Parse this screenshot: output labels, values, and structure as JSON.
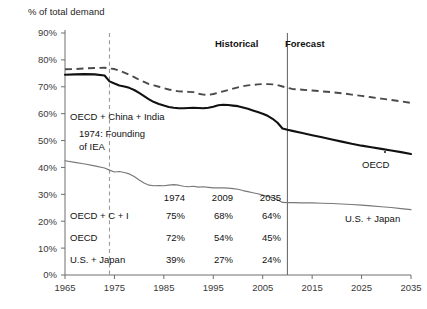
{
  "chart_data": {
    "type": "line",
    "title": "",
    "ylabel": "% of total demand",
    "xlabel": "",
    "ylim": [
      0,
      90
    ],
    "xlim": [
      1965,
      2035
    ],
    "grid": false,
    "legend_position": "inline-labels",
    "y_ticks": [
      "0%",
      "10%",
      "20%",
      "30%",
      "40%",
      "50%",
      "60%",
      "70%",
      "80%",
      "90%"
    ],
    "y_tick_values": [
      0,
      10,
      20,
      30,
      40,
      50,
      60,
      70,
      80,
      90
    ],
    "x_ticks": [
      "1965",
      "1975",
      "1985",
      "1995",
      "2005",
      "2015",
      "2025",
      "2035"
    ],
    "x_tick_values": [
      1965,
      1975,
      1985,
      1995,
      2005,
      2015,
      2025,
      2035
    ],
    "series": [
      {
        "name": "OECD + China + India",
        "style": "dashed",
        "color": "#4a4a4a",
        "x": [
          1965,
          1967,
          1969,
          1971,
          1973,
          1974,
          1975,
          1976,
          1977,
          1978,
          1979,
          1980,
          1981,
          1982,
          1983,
          1984,
          1985,
          1986,
          1987,
          1988,
          1989,
          1990,
          1991,
          1992,
          1993,
          1994,
          1995,
          1996,
          1997,
          1998,
          1999,
          2000,
          2001,
          2002,
          2003,
          2004,
          2005,
          2006,
          2007,
          2008,
          2009,
          2010,
          2011,
          2013,
          2015,
          2017,
          2019,
          2021,
          2023,
          2025,
          2027,
          2029,
          2031,
          2033,
          2035
        ],
        "y": [
          76.5,
          76.6,
          76.8,
          77.0,
          77.1,
          76.8,
          76.6,
          76.0,
          75.3,
          74.5,
          73.6,
          72.6,
          71.8,
          71.0,
          70.5,
          70.0,
          69.5,
          69.0,
          68.6,
          68.3,
          68.2,
          68.1,
          68.0,
          67.4,
          67.1,
          67.0,
          67.3,
          67.8,
          68.3,
          68.8,
          69.3,
          69.8,
          70.2,
          70.5,
          70.7,
          70.9,
          71.0,
          71.0,
          70.9,
          70.6,
          70.1,
          69.6,
          69.2,
          68.9,
          68.6,
          68.3,
          68.0,
          67.6,
          67.1,
          66.6,
          66.1,
          65.6,
          65.1,
          64.6,
          64.0
        ]
      },
      {
        "name": "OECD",
        "style": "solid-thick",
        "color": "#111111",
        "x": [
          1965,
          1967,
          1969,
          1971,
          1973,
          1974,
          1975,
          1976,
          1977,
          1978,
          1979,
          1980,
          1981,
          1982,
          1983,
          1984,
          1985,
          1986,
          1987,
          1988,
          1989,
          1990,
          1991,
          1992,
          1993,
          1994,
          1995,
          1996,
          1997,
          1998,
          1999,
          2000,
          2001,
          2002,
          2003,
          2004,
          2005,
          2006,
          2007,
          2008,
          2009,
          2010,
          2011,
          2013,
          2015,
          2017,
          2019,
          2021,
          2023,
          2025,
          2027,
          2029,
          2031,
          2033,
          2035
        ],
        "y": [
          74.5,
          74.6,
          74.7,
          74.6,
          74.2,
          72.0,
          71.2,
          70.5,
          70.1,
          69.6,
          68.8,
          67.7,
          66.5,
          65.3,
          64.3,
          63.6,
          63.0,
          62.5,
          62.2,
          62.0,
          62.0,
          62.1,
          62.2,
          62.1,
          62.0,
          62.2,
          62.6,
          63.1,
          63.3,
          63.2,
          63.0,
          62.8,
          62.3,
          61.8,
          61.2,
          60.6,
          60.0,
          59.2,
          58.1,
          56.6,
          54.5,
          54.0,
          53.6,
          52.8,
          52.0,
          51.2,
          50.4,
          49.6,
          48.8,
          48.1,
          47.5,
          46.9,
          46.3,
          45.7,
          45.0
        ]
      },
      {
        "name": "U.S. + Japan",
        "style": "solid-thin",
        "color": "#787878",
        "x": [
          1965,
          1967,
          1969,
          1971,
          1973,
          1974,
          1975,
          1976,
          1977,
          1978,
          1979,
          1980,
          1981,
          1982,
          1983,
          1984,
          1985,
          1986,
          1987,
          1988,
          1989,
          1990,
          1991,
          1992,
          1993,
          1994,
          1995,
          1996,
          1997,
          1998,
          1999,
          2000,
          2001,
          2002,
          2003,
          2004,
          2005,
          2006,
          2007,
          2008,
          2009,
          2010,
          2011,
          2013,
          2015,
          2017,
          2019,
          2021,
          2023,
          2025,
          2027,
          2029,
          2031,
          2033,
          2035
        ],
        "y": [
          42.5,
          41.9,
          41.3,
          40.6,
          39.8,
          39.0,
          38.3,
          38.5,
          38.1,
          37.6,
          36.6,
          35.3,
          34.2,
          33.4,
          33.2,
          33.3,
          33.2,
          33.4,
          33.6,
          33.4,
          33.0,
          32.8,
          33.0,
          32.7,
          32.8,
          32.6,
          32.4,
          32.4,
          32.4,
          32.3,
          32.1,
          31.9,
          31.4,
          31.0,
          30.6,
          30.2,
          29.7,
          29.2,
          28.7,
          28.0,
          27.0,
          26.9,
          26.9,
          26.8,
          26.8,
          26.7,
          26.6,
          26.4,
          26.2,
          26.0,
          25.7,
          25.4,
          25.1,
          24.7,
          24.3
        ]
      }
    ],
    "annotations": [
      {
        "id": "historical",
        "text": "Historical",
        "bold": true
      },
      {
        "id": "forecast",
        "text": "Forecast",
        "bold": true
      },
      {
        "id": "oecd-cn-in",
        "text": "OECD + China + India",
        "bold": false
      },
      {
        "id": "iea-line1",
        "text": "1974: Founding",
        "bold": false
      },
      {
        "id": "iea-line2",
        "text": "of IEA",
        "bold": false
      },
      {
        "id": "oecd-label",
        "text": "OECD",
        "bold": false
      },
      {
        "id": "usjapan-label",
        "text": "U.S. + Japan",
        "bold": false
      }
    ],
    "marker_year": 1974,
    "forecast_start_year": 2010,
    "table": {
      "column_headers": [
        "",
        "1974",
        "2009",
        "2035"
      ],
      "rows": [
        {
          "label": "OECD + C + I",
          "values": [
            "75%",
            "68%",
            "64%"
          ]
        },
        {
          "label": "OECD",
          "values": [
            "72%",
            "54%",
            "45%"
          ]
        },
        {
          "label": "U.S. + Japan",
          "values": [
            "39%",
            "27%",
            "24%"
          ]
        }
      ]
    }
  }
}
